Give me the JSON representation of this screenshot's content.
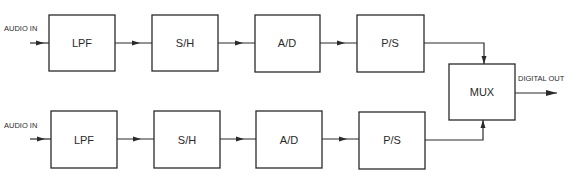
{
  "diagram": {
    "title": "",
    "channels": [
      {
        "input_label": "AUDIO IN",
        "blocks": [
          "LPF",
          "S/H",
          "A/D",
          "P/S"
        ]
      },
      {
        "input_label": "AUDIO IN",
        "blocks": [
          "LPF",
          "S/H",
          "A/D",
          "P/S"
        ]
      }
    ],
    "mux": {
      "label": "MUX"
    },
    "output_label": "DIGITAL OUT",
    "colors": {
      "line": "#2a2a2a",
      "background": "#ffffff"
    }
  }
}
